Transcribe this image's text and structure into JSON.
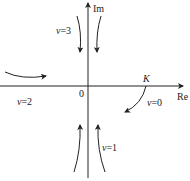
{
  "diagram": {
    "axes": {
      "real_label": "Re",
      "imag_label": "Im",
      "origin_label": "0"
    },
    "point_label": "K",
    "branches": [
      {
        "label": "v=3",
        "var": "v",
        "eq": "=3",
        "direction": "from top, approaching imaginary axis upper half"
      },
      {
        "label": "v=2",
        "var": "v",
        "eq": "=2",
        "direction": "from left, approaching real axis"
      },
      {
        "label": "v=1",
        "var": "v",
        "eq": "=1",
        "direction": "from bottom, approaching imaginary axis lower half"
      },
      {
        "label": "v=0",
        "var": "v",
        "eq": "=0",
        "direction": "from point K, going down-left"
      }
    ],
    "colors": {
      "stroke": "#222222",
      "background": "#ffffff"
    }
  }
}
